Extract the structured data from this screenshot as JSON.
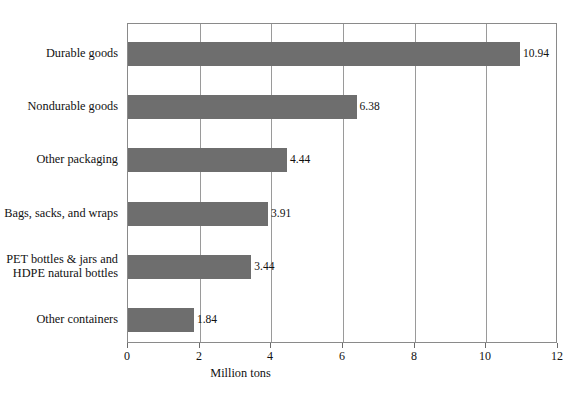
{
  "chart_data": {
    "type": "bar",
    "orientation": "horizontal",
    "title": "",
    "xlabel": "Million tons",
    "ylabel": "",
    "xlim": [
      0,
      12
    ],
    "xticks": [
      0,
      2,
      4,
      6,
      8,
      10,
      12
    ],
    "xtick_labels": [
      "0",
      "2",
      "4",
      "6",
      "8",
      "10",
      "12"
    ],
    "grid": "vertical",
    "legend": "none",
    "bar_color": "#6e6e6e",
    "frame_color": "#8a8a8a",
    "categories": [
      "Durable goods",
      "Nondurable goods",
      "Other packaging",
      "Bags, sacks, and wraps",
      "PET bottles & jars and\nHDPE natural bottles",
      "Other containers"
    ],
    "values": [
      10.94,
      6.38,
      4.44,
      3.91,
      3.44,
      1.84
    ],
    "value_labels": [
      "10.94",
      "6.38",
      "4.44",
      "3.91",
      "3.44",
      "1.84"
    ],
    "bars": [
      {
        "category_line1": "Durable goods",
        "category_line2": "",
        "value": 10.94,
        "value_label": "10.94"
      },
      {
        "category_line1": "Nondurable goods",
        "category_line2": "",
        "value": 6.38,
        "value_label": "6.38"
      },
      {
        "category_line1": "Other packaging",
        "category_line2": "",
        "value": 4.44,
        "value_label": "4.44"
      },
      {
        "category_line1": "Bags, sacks, and wraps",
        "category_line2": "",
        "value": 3.91,
        "value_label": "3.91"
      },
      {
        "category_line1": "PET bottles & jars and",
        "category_line2": "HDPE natural bottles",
        "value": 3.44,
        "value_label": "3.44"
      },
      {
        "category_line1": "Other containers",
        "category_line2": "",
        "value": 1.84,
        "value_label": "1.84"
      }
    ]
  }
}
